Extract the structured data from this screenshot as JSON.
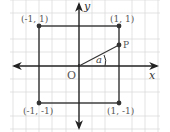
{
  "diagram": {
    "axes": {
      "x_label": "x",
      "y_label": "y",
      "origin_label": "O"
    },
    "points": [
      {
        "name": "top-left",
        "label": "(-1, 1)"
      },
      {
        "name": "top-right",
        "label": "(1, 1)"
      },
      {
        "name": "bottom-left",
        "label": "(-1, -1)"
      },
      {
        "name": "bottom-right",
        "label": "(1, -1)"
      },
      {
        "name": "P",
        "label": "P"
      }
    ],
    "angle_label": "a",
    "colors": {
      "grid": "#dcdcdc",
      "lines": "#333333",
      "points": "#333333",
      "text": "#555555"
    }
  }
}
